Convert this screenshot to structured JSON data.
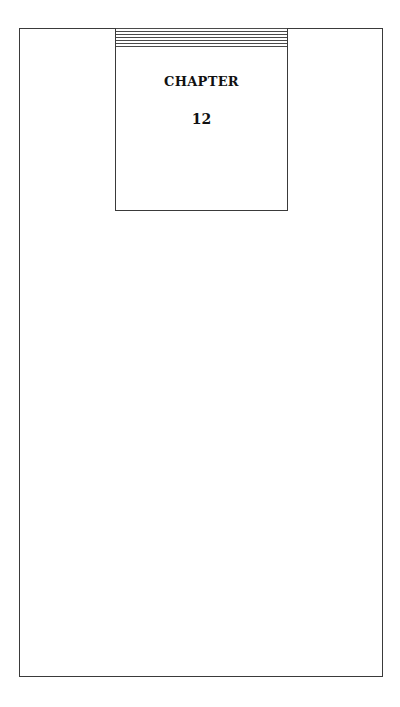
{
  "page": {
    "chapter_label": "CHAPTER",
    "chapter_number": "12",
    "colors": {
      "border": "#3a3a3a",
      "text": "#111111",
      "background": "#ffffff"
    }
  }
}
